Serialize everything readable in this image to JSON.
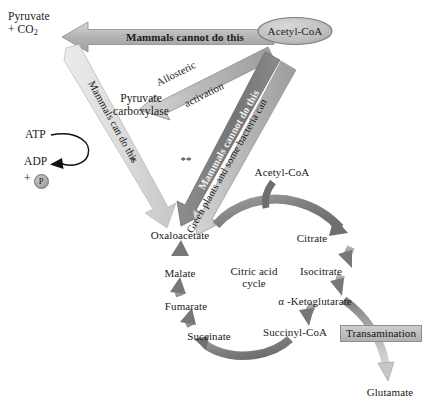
{
  "diagram": {
    "nodes": {
      "pyruvate_co2": "Pyruvate\n+ CO2",
      "pyruvate_line1": "Pyruvate",
      "pyruvate_line2_sub": "+ CO",
      "pyruvate_sub": "2",
      "acetyl_coa_top": "Acetyl-CoA",
      "pyruvate_carboxylase_l1": "Pyruvate",
      "pyruvate_carboxylase_l2": "carboxylase",
      "atp": "ATP",
      "adp": "ADP",
      "plus": "+",
      "phosphate": "P",
      "acetyl_coa_cycle": "Acetyl-CoA",
      "oxaloacetate": "Oxaloacetate",
      "citrate": "Citrate",
      "isocitrate": "Isocitrate",
      "alpha_ketoglutarate": "α -Ketoglutarate",
      "succinyl_coa": "Succinyl-CoA",
      "succinate": "Succinate",
      "fumarate": "Fumarate",
      "malate": "Malate",
      "glutamate": "Glutamate",
      "cycle_name_l1": "Citric acid",
      "cycle_name_l2": "cycle",
      "transamination": "Transamination"
    },
    "arrow_labels": {
      "top_banner": "Mammals cannot do this",
      "allosteric_l1": "Allosteric",
      "allosteric_l2": "activation",
      "left_diagonal": "Mammals can do this",
      "right_diagonal_dark": "Mammals cannot do this",
      "right_diagonal_light": "Green plants and some bacteria can"
    },
    "footnote_markers": {
      "single": "*",
      "double": "**"
    },
    "colors": {
      "arrow_dark": "#6e6e6e",
      "arrow_mid": "#9a9a9a",
      "arrow_light": "#d2d2d2",
      "arrow_very_light": "#e2e2e2",
      "outline": "#8e8e8e",
      "text": "#1a1a1a",
      "banner_fill": "#b9b9b9",
      "cycle_arrow": "#8c8c8c"
    }
  }
}
